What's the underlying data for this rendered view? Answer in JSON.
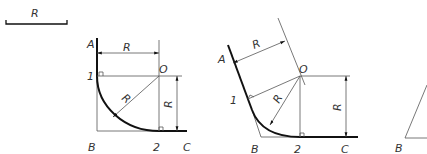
{
  "scale": {
    "label": "R"
  },
  "figure1": {
    "points": {
      "A": "A",
      "B": "B",
      "C": "C",
      "O": "O",
      "p1": "1",
      "p2": "2"
    },
    "dims": {
      "horizontal": "R",
      "vertical": "R",
      "radius": "R"
    }
  },
  "figure2": {
    "points": {
      "A": "A",
      "B": "B",
      "C": "C",
      "O": "O",
      "p1": "1",
      "p2": "2"
    },
    "dims": {
      "slanted": "R",
      "vertical": "R",
      "radius": "R"
    }
  },
  "figure3": {
    "points": {
      "B": "B"
    }
  },
  "colors": {
    "thin_line": "#555555",
    "thick_line": "#111111",
    "text": "#333333"
  }
}
